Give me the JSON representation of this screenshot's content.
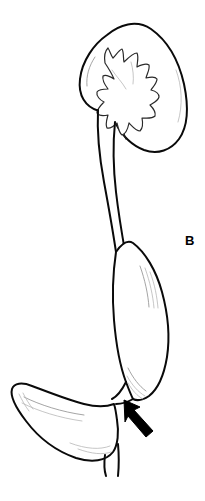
{
  "figure": {
    "panel_label": "B",
    "background_color": "#ffffff",
    "line_color": "#0a0a0a",
    "shading_color": "#9a9a9a",
    "arrow_color": "#000000",
    "width": 205,
    "height": 501
  },
  "structures": {
    "kidney": {
      "name": "kidney",
      "label": "kidney"
    },
    "calyces": {
      "name": "renal-calyces",
      "label": "renal calyces"
    },
    "renal_pelvis": {
      "name": "renal-pelvis",
      "label": "renal pelvis"
    },
    "proximal_ureter": {
      "name": "proximal-ureter",
      "label": "proximal ureter"
    },
    "dilated_ureter": {
      "name": "dilated-distal-ureter",
      "label": "dilated distal ureter"
    },
    "bladder": {
      "name": "urinary-bladder",
      "label": "urinary bladder"
    },
    "urethra": {
      "name": "urethra",
      "label": "urethra"
    },
    "arrow": {
      "name": "narrowing-arrow",
      "label": "arrow marking narrowed segment"
    }
  }
}
